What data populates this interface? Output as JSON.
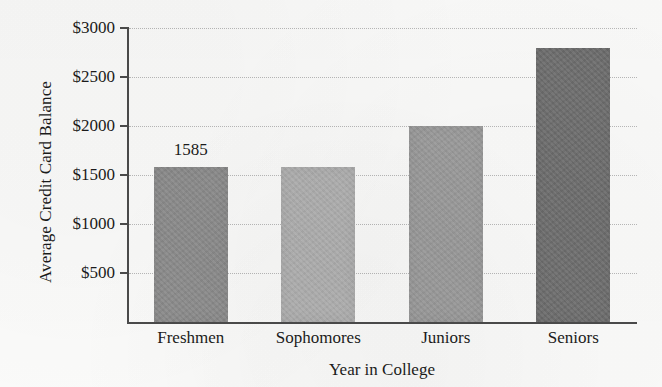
{
  "chart_data": {
    "type": "bar",
    "title": "",
    "xlabel": "Year in College",
    "ylabel": "Average Credit Card Balance",
    "categories": [
      "Freshmen",
      "Sophomores",
      "Juniors",
      "Seniors"
    ],
    "values": [
      1585,
      1585,
      2000,
      2800
    ],
    "bar_colors": [
      "#8d8d8d",
      "#b2b2b2",
      "#9c9c9c",
      "#6f6f6f"
    ],
    "data_labels": [
      "1585",
      "",
      "",
      ""
    ],
    "ylim": [
      0,
      3000
    ],
    "ytick_values": [
      500,
      1000,
      1500,
      2000,
      2500,
      3000
    ],
    "ytick_labels": [
      "$500",
      "$1000",
      "$1500",
      "$2000",
      "$2500",
      "$3000"
    ],
    "grid": true,
    "grid_style": "dotted",
    "legend": "none",
    "axis_color": "#4b4b4b",
    "background_color": "#fbfbfa"
  }
}
